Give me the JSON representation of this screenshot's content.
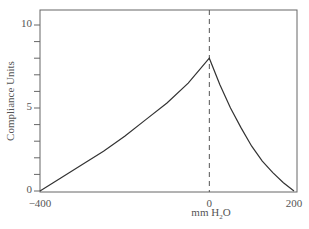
{
  "chart_data": {
    "type": "line",
    "title": "",
    "xlabel": "mm H₂O",
    "xlabel_base": "mm H",
    "xlabel_sub": "2",
    "xlabel_tail": "O",
    "ylabel": "Compliance Units",
    "xlim": [
      -400,
      200
    ],
    "ylim": [
      0,
      10
    ],
    "xticks": [
      -400,
      0,
      200
    ],
    "xtick_labels": [
      "−400",
      "0",
      "200"
    ],
    "yticks": [
      0,
      5,
      10
    ],
    "ytick_labels": [
      "0",
      "5",
      "10"
    ],
    "yminor_step": 1,
    "grid": false,
    "legend": null,
    "reference_line": {
      "x": 0,
      "style": "dashed"
    },
    "series": [
      {
        "name": "Compliance",
        "x": [
          -400,
          -350,
          -300,
          -250,
          -200,
          -150,
          -100,
          -50,
          0,
          25,
          50,
          75,
          100,
          125,
          150,
          175,
          200
        ],
        "y": [
          0,
          0.8,
          1.6,
          2.4,
          3.3,
          4.3,
          5.3,
          6.5,
          8.0,
          6.4,
          5.0,
          3.8,
          2.7,
          1.8,
          1.1,
          0.5,
          0
        ]
      }
    ]
  }
}
